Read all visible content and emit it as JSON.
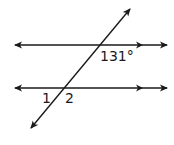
{
  "diagram": {
    "colors": {
      "stroke": "#1a1a1a",
      "background": "#ffffff"
    },
    "labels": {
      "given_angle": "131°",
      "angle_1": "1",
      "angle_2": "2"
    },
    "lines": {
      "top_parallel": {
        "x1": 15,
        "y1": 45,
        "x2": 167,
        "y2": 45
      },
      "bottom_parallel": {
        "x1": 15,
        "y1": 88,
        "x2": 167,
        "y2": 88
      },
      "transversal": {
        "x1": 130,
        "y1": 9,
        "x2": 31,
        "y2": 128
      }
    }
  }
}
